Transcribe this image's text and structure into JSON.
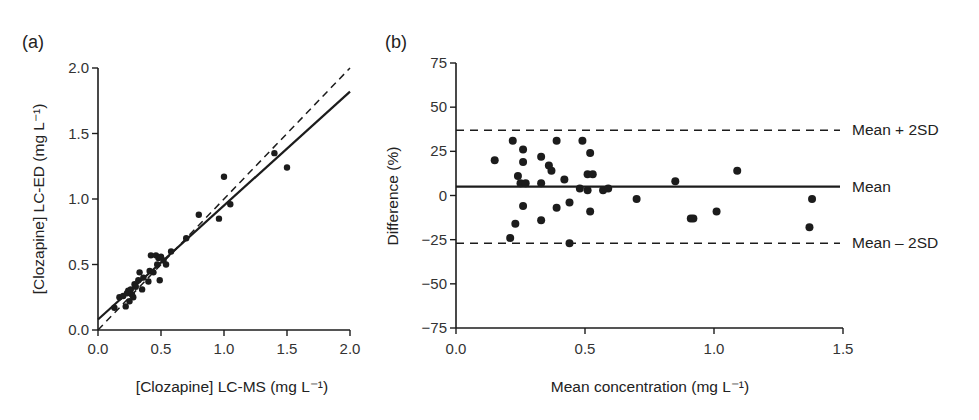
{
  "figure": {
    "panel_a_label": "(a)",
    "panel_b_label": "(b)"
  },
  "chart_data": [
    {
      "type": "scatter",
      "panel": "(a)",
      "title": "",
      "xlabel": "[Clozapine] LC-MS (mg L⁻¹)",
      "ylabel": "[Clozapine] LC-ED (mg L⁻¹)",
      "xlim": [
        0.0,
        2.0
      ],
      "ylim": [
        0.0,
        2.0
      ],
      "xticks": [
        "0.0",
        "0.5",
        "1.0",
        "1.5",
        "2.0"
      ],
      "yticks": [
        "0.0",
        "0.5",
        "1.0",
        "1.5",
        "2.0"
      ],
      "grid": false,
      "lines": [
        {
          "name": "regression",
          "style": "solid",
          "from": [
            0.0,
            0.08
          ],
          "to": [
            2.0,
            1.82
          ]
        },
        {
          "name": "line of identity",
          "style": "dashed",
          "from": [
            0.0,
            0.0
          ],
          "to": [
            2.0,
            2.0
          ]
        }
      ],
      "points": [
        [
          0.13,
          0.17
        ],
        [
          0.17,
          0.25
        ],
        [
          0.2,
          0.26
        ],
        [
          0.22,
          0.18
        ],
        [
          0.23,
          0.28
        ],
        [
          0.24,
          0.3
        ],
        [
          0.25,
          0.22
        ],
        [
          0.26,
          0.31
        ],
        [
          0.27,
          0.27
        ],
        [
          0.28,
          0.25
        ],
        [
          0.29,
          0.35
        ],
        [
          0.3,
          0.33
        ],
        [
          0.32,
          0.38
        ],
        [
          0.33,
          0.44
        ],
        [
          0.35,
          0.31
        ],
        [
          0.36,
          0.4
        ],
        [
          0.4,
          0.37
        ],
        [
          0.41,
          0.45
        ],
        [
          0.42,
          0.57
        ],
        [
          0.44,
          0.44
        ],
        [
          0.46,
          0.57
        ],
        [
          0.47,
          0.5
        ],
        [
          0.48,
          0.55
        ],
        [
          0.49,
          0.38
        ],
        [
          0.5,
          0.56
        ],
        [
          0.52,
          0.53
        ],
        [
          0.54,
          0.5
        ],
        [
          0.58,
          0.6
        ],
        [
          0.7,
          0.7
        ],
        [
          0.8,
          0.88
        ],
        [
          0.96,
          0.85
        ],
        [
          1.0,
          1.17
        ],
        [
          1.05,
          0.96
        ],
        [
          1.4,
          1.35
        ],
        [
          1.5,
          1.24
        ]
      ]
    },
    {
      "type": "scatter",
      "panel": "(b)",
      "title": "",
      "xlabel": "Mean concentration (mg L⁻¹)",
      "ylabel": "Difference (%)",
      "xlim": [
        0.0,
        1.5
      ],
      "ylim": [
        -75,
        75
      ],
      "xticks": [
        "0.0",
        "0.5",
        "1.0",
        "1.5"
      ],
      "yticks": [
        "75",
        "50",
        "25",
        "0",
        "−25",
        "−50",
        "−75"
      ],
      "grid": false,
      "reference_lines": [
        {
          "name": "Mean + 2SD",
          "style": "dashed",
          "y": 37
        },
        {
          "name": "Mean",
          "style": "solid",
          "y": 5
        },
        {
          "name": "Mean – 2SD",
          "style": "dashed",
          "y": -27
        }
      ],
      "points": [
        [
          0.15,
          20
        ],
        [
          0.22,
          31
        ],
        [
          0.24,
          11
        ],
        [
          0.26,
          26
        ],
        [
          0.26,
          19
        ],
        [
          0.25,
          7
        ],
        [
          0.27,
          7
        ],
        [
          0.33,
          22
        ],
        [
          0.33,
          7
        ],
        [
          0.36,
          17
        ],
        [
          0.37,
          14
        ],
        [
          0.39,
          31
        ],
        [
          0.42,
          9
        ],
        [
          0.49,
          31
        ],
        [
          0.52,
          24
        ],
        [
          0.51,
          12
        ],
        [
          0.53,
          12
        ],
        [
          0.48,
          4
        ],
        [
          0.51,
          3
        ],
        [
          0.57,
          3
        ],
        [
          0.59,
          4
        ],
        [
          0.26,
          -6
        ],
        [
          0.23,
          -16
        ],
        [
          0.21,
          -24
        ],
        [
          0.33,
          -14
        ],
        [
          0.39,
          -7
        ],
        [
          0.44,
          -4
        ],
        [
          0.44,
          -27
        ],
        [
          0.52,
          -9
        ],
        [
          0.7,
          -2
        ],
        [
          0.85,
          8
        ],
        [
          1.09,
          14
        ],
        [
          0.91,
          -13
        ],
        [
          0.92,
          -13
        ],
        [
          1.01,
          -9
        ],
        [
          1.38,
          -2
        ],
        [
          1.37,
          -18
        ]
      ]
    }
  ]
}
